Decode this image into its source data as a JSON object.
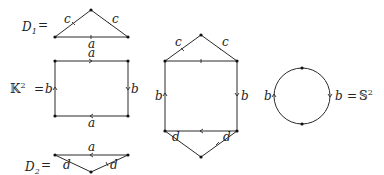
{
  "figures": {
    "d1": {
      "name_label": "D",
      "name_sub": "1",
      "equals": "=",
      "edges": {
        "left": "c",
        "right": "c",
        "base": "a"
      }
    },
    "klein": {
      "name_label": "𝕂",
      "name_sup": "2",
      "equals": "=",
      "edges": {
        "top": "a",
        "bottom": "a",
        "left": "b",
        "right": "b"
      }
    },
    "d2": {
      "name_label": "D",
      "name_sub": "2",
      "equals": "=",
      "edges": {
        "top": "a",
        "left": "d",
        "right": "d"
      }
    },
    "hexagon": {
      "edges": {
        "upper_left": "c",
        "upper_right": "c",
        "left": "b",
        "right": "b",
        "lower_left": "d",
        "lower_right": "d"
      }
    },
    "sphere": {
      "edges": {
        "left": "b",
        "right": "b"
      },
      "equals": "=",
      "name_label": "𝕊",
      "name_sup": "2"
    }
  },
  "colors": {
    "line": "#2a2a2a",
    "vertex": "#111111",
    "text": "#222222"
  }
}
